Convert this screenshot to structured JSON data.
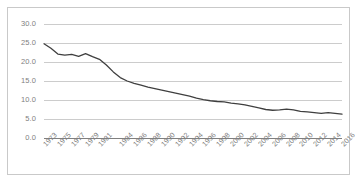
{
  "chart_data": {
    "type": "line",
    "title": "",
    "subtitle": "",
    "xlabel": "",
    "ylabel": "",
    "grid": "horizontal",
    "legend": "none",
    "xlim": [
      1973,
      2016
    ],
    "ylim": [
      0.0,
      30.0
    ],
    "y_ticks": [
      "0.0",
      "5.0",
      "10.0",
      "15.0",
      "20.0",
      "25.0",
      "30.0"
    ],
    "y_tick_values": [
      0.0,
      5.0,
      10.0,
      15.0,
      20.0,
      25.0,
      30.0
    ],
    "x_tick_labels": [
      "1973",
      "1975",
      "1977",
      "1979",
      "1981",
      "1984",
      "1986",
      "1988",
      "1990",
      "1992",
      "1994",
      "1996",
      "1998",
      "2000",
      "2002",
      "2004",
      "2006",
      "2008",
      "2010",
      "2012",
      "2014",
      "2016"
    ],
    "x_tick_values": [
      1973,
      1975,
      1977,
      1979,
      1981,
      1984,
      1986,
      1988,
      1990,
      1992,
      1994,
      1996,
      1998,
      2000,
      2002,
      2004,
      2006,
      2008,
      2010,
      2012,
      2014,
      2016
    ],
    "series": [
      {
        "name": "",
        "color": "#3f3f3f",
        "x": [
          1973,
          1974,
          1975,
          1976,
          1977,
          1978,
          1979,
          1980,
          1981,
          1982,
          1983,
          1984,
          1985,
          1986,
          1987,
          1988,
          1989,
          1990,
          1991,
          1992,
          1993,
          1994,
          1995,
          1996,
          1997,
          1998,
          1999,
          2000,
          2001,
          2002,
          2003,
          2004,
          2005,
          2006,
          2007,
          2008,
          2009,
          2010,
          2011,
          2012,
          2013,
          2014,
          2015,
          2016
        ],
        "values": [
          24.8,
          23.6,
          22.1,
          21.8,
          22.0,
          21.5,
          22.2,
          21.4,
          20.7,
          19.2,
          17.4,
          15.9,
          15.0,
          14.4,
          13.9,
          13.4,
          13.0,
          12.6,
          12.2,
          11.8,
          11.4,
          11.0,
          10.5,
          10.1,
          9.8,
          9.6,
          9.5,
          9.2,
          9.0,
          8.7,
          8.3,
          7.9,
          7.5,
          7.3,
          7.4,
          7.6,
          7.4,
          7.0,
          6.9,
          6.7,
          6.5,
          6.7,
          6.5,
          6.3
        ]
      }
    ]
  },
  "colors": {
    "line": "#3f3f3f",
    "gridline": "#bfbfbf",
    "axis": "#7f7f7f",
    "tick_text": "#808080",
    "frame_border": "#c9c9c9",
    "background": "#ffffff"
  }
}
